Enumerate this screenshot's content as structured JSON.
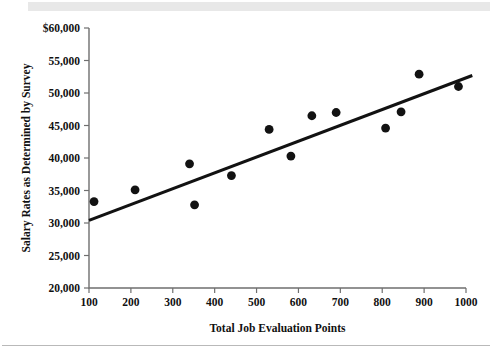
{
  "figure": {
    "background_color": "#ffffff",
    "band_color": "#e8e8e8",
    "rule_color": "#b9b9b9"
  },
  "chart_data": {
    "type": "scatter",
    "title": "",
    "xlabel": "Total Job Evaluation Points",
    "ylabel": "Salary Rates as Determined by Survey",
    "xlim": [
      100,
      1000
    ],
    "ylim": [
      20000,
      60000
    ],
    "grid": false,
    "legend": null,
    "xticks": [
      100,
      200,
      300,
      400,
      500,
      600,
      700,
      800,
      900,
      1000
    ],
    "xtick_labels": [
      "100",
      "200",
      "300",
      "400",
      "500",
      "600",
      "700",
      "800",
      "900",
      "1000"
    ],
    "yticks": [
      20000,
      25000,
      30000,
      35000,
      40000,
      45000,
      50000,
      55000,
      60000
    ],
    "ytick_labels": [
      "20,000",
      "25,000",
      "30,000",
      "35,000",
      "40,000",
      "45,000",
      "50,000",
      "55,000",
      "$60,000"
    ],
    "marker_color": "#121212",
    "line_color": "#121212",
    "points": [
      {
        "x": 112,
        "y": 33300
      },
      {
        "x": 210,
        "y": 35100
      },
      {
        "x": 340,
        "y": 39100
      },
      {
        "x": 352,
        "y": 32800
      },
      {
        "x": 440,
        "y": 37300
      },
      {
        "x": 530,
        "y": 44400
      },
      {
        "x": 582,
        "y": 40300
      },
      {
        "x": 632,
        "y": 46500
      },
      {
        "x": 690,
        "y": 47000
      },
      {
        "x": 808,
        "y": 44600
      },
      {
        "x": 845,
        "y": 47100
      },
      {
        "x": 888,
        "y": 52900
      },
      {
        "x": 982,
        "y": 51000
      }
    ],
    "trendline": {
      "name": "linear fit",
      "x_start": 100,
      "y_start": 30400,
      "x_end": 1015,
      "y_end": 52700
    }
  }
}
